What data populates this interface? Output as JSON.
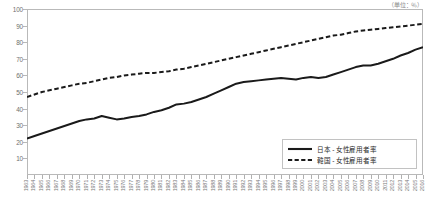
{
  "unit_label": "（単位：％）",
  "legend": {
    "items": [
      {
        "label": "日本 - 女性雇用者率",
        "style": "solid"
      },
      {
        "label": "韓国 - 女性雇用者率",
        "style": "dashed"
      }
    ]
  },
  "chart_data": {
    "type": "line",
    "title": "",
    "xlabel": "",
    "ylabel": "",
    "unit": "％",
    "ylim": [
      0,
      100
    ],
    "yticks": [
      0,
      10,
      20,
      30,
      40,
      50,
      60,
      70,
      80,
      90,
      100
    ],
    "ytick_labels": [
      "0",
      "10",
      "20",
      "30",
      "40",
      "50",
      "60",
      "70",
      "80",
      "90",
      "100"
    ],
    "grid": false,
    "legend_position": "bottom-right",
    "categories": [
      "1963",
      "1964",
      "1965",
      "1966",
      "1967",
      "1968",
      "1969",
      "1970",
      "1971",
      "1972",
      "1973",
      "1974",
      "1975",
      "1976",
      "1977",
      "1978",
      "1979",
      "1980",
      "1981",
      "1982",
      "1983",
      "1984",
      "1985",
      "1986",
      "1987",
      "1988",
      "1989",
      "1990",
      "1991",
      "1992",
      "1993",
      "1994",
      "1995",
      "1996",
      "1997",
      "1998",
      "1999",
      "2000",
      "2001",
      "2002",
      "2003",
      "2004",
      "2005",
      "2006",
      "2007",
      "2008",
      "2009",
      "2010",
      "2011",
      "2012",
      "2013",
      "2014",
      "2015",
      "2016"
    ],
    "series": [
      {
        "name": "日本 - 女性雇用者率",
        "style": "solid",
        "color": "#1a1a1a",
        "values": [
          22.0,
          23.5,
          25.0,
          26.5,
          28.0,
          29.5,
          31.0,
          32.5,
          33.5,
          34.0,
          35.5,
          34.5,
          33.5,
          34.0,
          35.0,
          35.5,
          36.5,
          38.0,
          39.0,
          40.5,
          42.5,
          43.0,
          44.0,
          45.5,
          47.0,
          49.0,
          51.0,
          53.0,
          55.0,
          56.0,
          56.5,
          57.0,
          57.5,
          58.0,
          58.5,
          58.0,
          57.5,
          58.5,
          59.0,
          58.5,
          59.0,
          60.5,
          62.0,
          63.5,
          65.0,
          66.0,
          66.0,
          67.0,
          68.5,
          70.0,
          72.0,
          73.5,
          75.5,
          77.0
        ]
      },
      {
        "name": "韓国 - 女性雇用者率",
        "style": "dashed",
        "color": "#1a1a1a",
        "values": [
          47.0,
          48.5,
          50.0,
          51.0,
          52.0,
          53.0,
          54.0,
          55.0,
          55.5,
          56.5,
          57.5,
          58.5,
          59.0,
          60.0,
          60.5,
          61.0,
          61.5,
          61.5,
          62.0,
          62.5,
          63.5,
          64.0,
          65.0,
          66.0,
          67.0,
          68.0,
          69.0,
          70.0,
          71.0,
          72.0,
          73.0,
          74.0,
          75.0,
          76.0,
          77.0,
          78.0,
          79.0,
          80.0,
          81.0,
          82.0,
          83.0,
          84.0,
          84.5,
          85.5,
          86.5,
          87.0,
          87.5,
          88.0,
          88.5,
          89.0,
          89.5,
          90.0,
          90.5,
          91.0
        ]
      }
    ]
  }
}
